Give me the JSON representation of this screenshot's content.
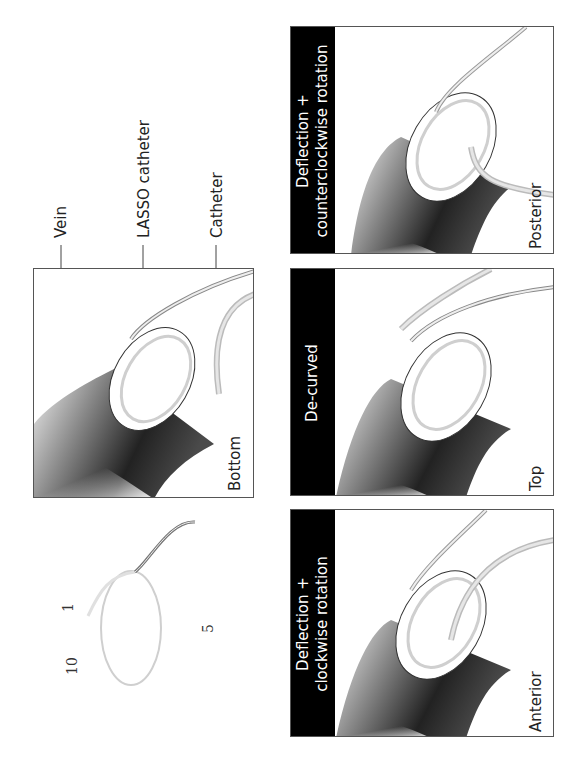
{
  "callouts": {
    "vein": "Vein",
    "lasso_catheter": "LASSO catheter",
    "catheter": "Catheter"
  },
  "lasso_electrode_numbers": [
    "1",
    "5",
    "10"
  ],
  "panels": [
    {
      "id": "bottom",
      "view_label": "Bottom",
      "title": null
    },
    {
      "id": "posterior",
      "view_label": "Posterior",
      "title_line1": "Deflection +",
      "title_line2": "counterclockwise rotation"
    },
    {
      "id": "top",
      "view_label": "Top",
      "title_line1": "De-curved",
      "title_line2": ""
    },
    {
      "id": "anterior",
      "view_label": "Anterior",
      "title_line1": "Deflection +",
      "title_line2": "clockwise rotation"
    }
  ],
  "colors": {
    "title_band": "#000000",
    "title_text": "#ffffff",
    "panel_border": "#555555",
    "lasso": "#cfcfcf",
    "catheter": "#d7d7d7",
    "vein_dark": "#2a2a2a"
  }
}
